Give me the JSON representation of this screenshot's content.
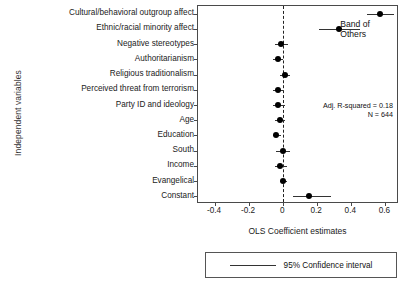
{
  "chart_data": {
    "type": "scatter",
    "xlabel": "OLS Coefficient estimates",
    "ylabel": "Independent variables",
    "xlim": [
      -0.5,
      0.68
    ],
    "xticks": [
      -0.4,
      -0.2,
      0,
      0.2,
      0.4,
      0.6
    ],
    "xticklabels": [
      "-0.4",
      "-0.2",
      "0",
      "0.2",
      "0.4",
      "0.6"
    ],
    "grid": false,
    "zero_reference_line": true,
    "categories": [
      "Cultural/behavioral outgroup affect",
      "Ethnic/racial minority affect",
      "Negative stereotypes",
      "Authoritarianism",
      "Religious traditionalism",
      "Perceived threat from terrorism",
      "Party ID and ideology",
      "Age",
      "Education",
      "South",
      "Income",
      "Evangelical",
      "Constant"
    ],
    "values": [
      0.57,
      0.33,
      -0.01,
      -0.03,
      0.01,
      -0.03,
      -0.03,
      -0.02,
      -0.04,
      0.0,
      -0.02,
      0.0,
      0.15
    ],
    "ci_low": [
      0.49,
      0.21,
      -0.05,
      -0.06,
      -0.02,
      -0.06,
      -0.06,
      -0.05,
      -0.06,
      -0.04,
      -0.05,
      -0.02,
      0.06
    ],
    "ci_high": [
      0.65,
      0.45,
      0.03,
      0.0,
      0.04,
      0.0,
      0.01,
      0.01,
      -0.01,
      0.04,
      0.02,
      0.02,
      0.28
    ],
    "annotations": {
      "r_squared": "Adj. R-squared = 0.18",
      "n": "N = 644"
    },
    "legend": {
      "position": "bottom",
      "entries": [
        "95% Confidence interval"
      ]
    },
    "colors": {
      "point": "#000000",
      "ci_line": "#333333",
      "axis": "#4a4a4a",
      "zero_line": "#222222"
    }
  }
}
